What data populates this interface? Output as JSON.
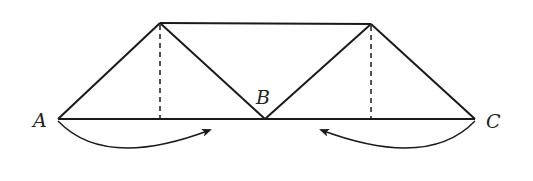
{
  "diagram": {
    "type": "truss-fold",
    "colors": {
      "stroke": "#1a1a1a",
      "background": "#ffffff",
      "label": "#222222"
    },
    "points": {
      "A": {
        "label": "A",
        "x": 58,
        "y": 119
      },
      "B": {
        "label": "B",
        "x": 265,
        "y": 119
      },
      "C": {
        "label": "C",
        "x": 475,
        "y": 119
      },
      "P": {
        "x": 160,
        "y": 23
      },
      "Q": {
        "x": 371,
        "y": 24
      }
    },
    "segments": [
      {
        "from": "A",
        "to": "C",
        "style": "solid"
      },
      {
        "from": "P",
        "to": "Q",
        "style": "solid"
      },
      {
        "from": "A",
        "to": "P",
        "style": "solid"
      },
      {
        "from": "P",
        "to": "B",
        "style": "solid"
      },
      {
        "from": "B",
        "to": "Q",
        "style": "solid"
      },
      {
        "from": "Q",
        "to": "C",
        "style": "solid"
      },
      {
        "from": "P",
        "to": "foot-P",
        "style": "dashed"
      },
      {
        "from": "Q",
        "to": "foot-Q",
        "style": "dashed"
      }
    ],
    "arrows": [
      {
        "name": "left-rotation-arrow",
        "from": "A",
        "direction": "clockwise",
        "tip": [
          210,
          129
        ]
      },
      {
        "name": "right-rotation-arrow",
        "from": "C",
        "direction": "counterclockwise",
        "tip": [
          320,
          129
        ]
      }
    ],
    "labels": {
      "a": "A",
      "b": "B",
      "c": "C"
    }
  }
}
